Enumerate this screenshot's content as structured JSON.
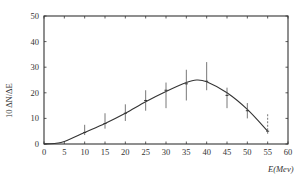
{
  "chart_data": {
    "type": "line",
    "title": "",
    "xlabel": "E(Mev)",
    "ylabel": "10 ΔN/ΔE",
    "xlim": [
      0,
      60
    ],
    "ylim": [
      0,
      50
    ],
    "xticks": [
      0,
      5,
      10,
      15,
      20,
      25,
      30,
      35,
      40,
      45,
      50,
      55,
      60
    ],
    "yticks": [
      0,
      10,
      20,
      30,
      40,
      50
    ],
    "grid": false,
    "legend": null,
    "series": [
      {
        "name": "measured",
        "kind": "points_with_error_bars",
        "x": [
          10,
          15,
          20,
          25,
          30,
          35,
          40,
          45,
          50,
          55
        ],
        "y": [
          4.5,
          8,
          12,
          17,
          21,
          23.5,
          24.5,
          19,
          13,
          5
        ],
        "y_err_low": [
          3.5,
          6,
          9,
          13,
          14,
          17,
          21,
          14,
          10,
          4
        ],
        "y_err_high": [
          7.5,
          12,
          15.5,
          21,
          24,
          29,
          32,
          22,
          16,
          12
        ],
        "dashed_error_bar_at": 55
      },
      {
        "name": "fitted curve",
        "kind": "smooth_line",
        "x": [
          0,
          3,
          5,
          10,
          15,
          20,
          25,
          30,
          35,
          37.5,
          40,
          45,
          50,
          55
        ],
        "y": [
          0,
          0.3,
          1,
          4.5,
          8,
          12,
          16.5,
          20.5,
          24,
          25,
          24.3,
          20,
          13.5,
          5
        ]
      }
    ]
  }
}
